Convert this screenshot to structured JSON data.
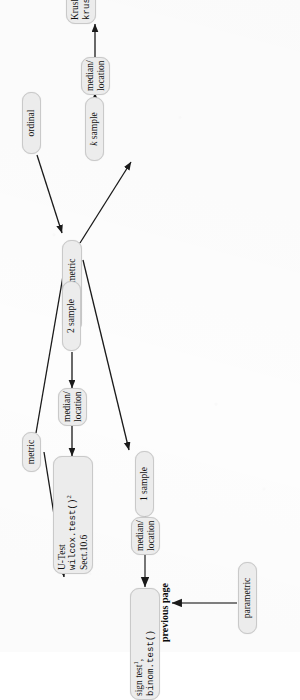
{
  "diagram": {
    "orientation": "rotated-90-ccw",
    "nodes": {
      "ordinal": {
        "label": "ordinal"
      },
      "metric": {
        "label": "metric"
      },
      "nonparametric": {
        "label": "nonparametric"
      },
      "parametric": {
        "label": "parametric"
      },
      "k_sample": {
        "label_prefix": "k",
        "label_rest": " sample"
      },
      "two_sample": {
        "label": "2 sample"
      },
      "one_sample": {
        "label": "1 sample"
      },
      "median_location_k": {
        "line1": "median/",
        "line2": "location"
      },
      "median_location_2": {
        "line1": "median/",
        "line2": "location"
      },
      "median_location_1": {
        "line1": "median/",
        "line2": "location"
      },
      "kruskal": {
        "line1_text": "Kruskal-Wallis test",
        "line1_sup": "3",
        "line2_code": "kruskal.test()"
      },
      "utest": {
        "line1_text": "U-Test",
        "line2_code": "wilcox.test()",
        "line2_sup": "2",
        "line3_text": "Sect.10.6"
      },
      "sign": {
        "line1_text": "sign test",
        "line1_sup": "1",
        "line1_tail": ",",
        "line2_code": "binom.test()"
      }
    },
    "labels": {
      "previous_page": "previous page"
    },
    "colors": {
      "node_fill": "#ececec",
      "node_border": "#c9c9c9",
      "ink": "#101010",
      "paper": "#fdfdfd"
    },
    "edges": [
      {
        "from": "ordinal",
        "to": "nonparametric"
      },
      {
        "from": "metric",
        "to": "nonparametric"
      },
      {
        "from": "metric",
        "to": "parametric"
      },
      {
        "from": "nonparametric",
        "to": "k_sample"
      },
      {
        "from": "nonparametric",
        "to": "two_sample"
      },
      {
        "from": "nonparametric",
        "to": "one_sample"
      },
      {
        "from": "k_sample",
        "to": "median_location_k"
      },
      {
        "from": "median_location_k",
        "to": "kruskal"
      },
      {
        "from": "two_sample",
        "to": "median_location_2"
      },
      {
        "from": "median_location_2",
        "to": "utest"
      },
      {
        "from": "one_sample",
        "to": "median_location_1"
      },
      {
        "from": "median_location_1",
        "to": "sign"
      },
      {
        "from": "parametric",
        "to": "previous_page"
      }
    ]
  }
}
